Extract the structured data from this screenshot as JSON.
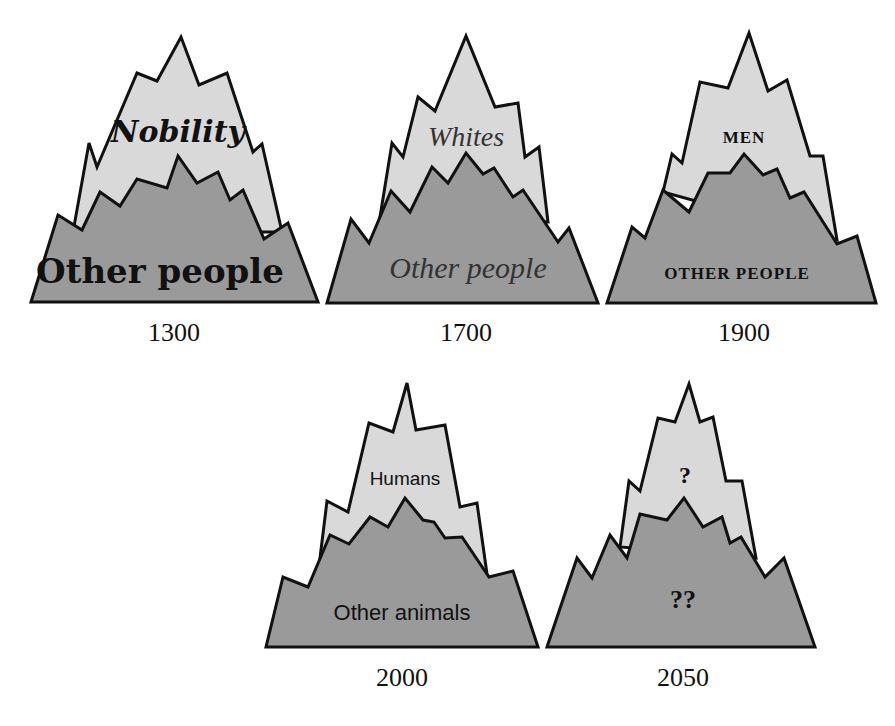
{
  "colors": {
    "upper_fill": "#d9d9d9",
    "lower_fill": "#9a9a9a",
    "stroke": "#111111",
    "background": "#ffffff"
  },
  "mountains": [
    {
      "year": "1300",
      "upper_label": "Nobility",
      "lower_label": "Other people",
      "upper_style": "blackletter",
      "lower_style": "blackletter"
    },
    {
      "year": "1700",
      "upper_label": "Whites",
      "lower_label": "Other people",
      "upper_style": "script",
      "lower_style": "script"
    },
    {
      "year": "1900",
      "upper_label": "MEN",
      "lower_label": "OTHER PEOPLE",
      "upper_style": "small-caps-serif",
      "lower_style": "small-caps-serif"
    },
    {
      "year": "2000",
      "upper_label": "Humans",
      "lower_label": "Other animals",
      "upper_style": "sans",
      "lower_style": "sans"
    },
    {
      "year": "2050",
      "upper_label": "?",
      "lower_label": "??",
      "upper_style": "serif-bold",
      "lower_style": "serif-bold"
    }
  ]
}
